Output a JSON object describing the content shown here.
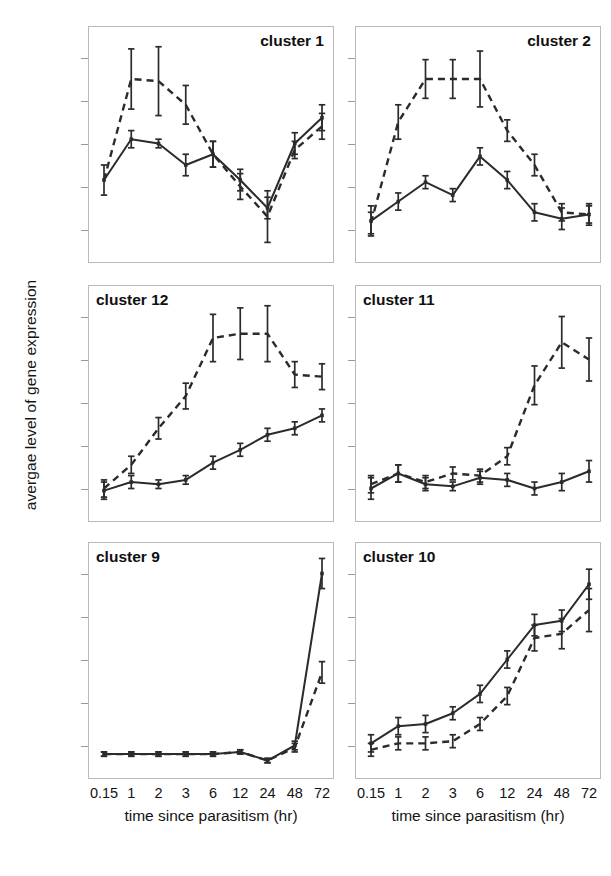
{
  "figure": {
    "y_axis_label": "avergae level of gene expression",
    "x_axis_label": "time since parasitism (hr)",
    "x_tick_labels": [
      "0.15",
      "1",
      "2",
      "3",
      "6",
      "12",
      "24",
      "48",
      "72"
    ],
    "line_color": "#2b2b2b",
    "frame_color": "#b9b9b9",
    "background": "#ffffff"
  },
  "panels": [
    {
      "label": "cluster 1",
      "label_side": "right"
    },
    {
      "label": "cluster 2",
      "label_side": "right"
    },
    {
      "label": "cluster 12",
      "label_side": "left"
    },
    {
      "label": "cluster 11",
      "label_side": "left"
    },
    {
      "label": "cluster 9",
      "label_side": "left"
    },
    {
      "label": "cluster 10",
      "label_side": "left"
    }
  ],
  "chart_data": [
    {
      "type": "line",
      "title": "cluster 1",
      "xlabel": "time since parasitism (hr)",
      "ylabel": "avergae level of gene expression",
      "x": [
        0.15,
        1,
        2,
        3,
        6,
        12,
        24,
        48,
        72
      ],
      "categories": [
        "0.15",
        "1",
        "2",
        "3",
        "6",
        "12",
        "24",
        "48",
        "72"
      ],
      "xscale": "categorical",
      "ylim": [
        0,
        1
      ],
      "grid": false,
      "legend": "none",
      "series": [
        {
          "name": "solid",
          "style": "solid",
          "values": [
            0.33,
            0.52,
            0.5,
            0.4,
            0.45,
            0.33,
            0.2,
            0.5,
            0.62
          ],
          "errors": [
            0.07,
            0.04,
            0.02,
            0.05,
            0.06,
            0.05,
            0.05,
            0.05,
            0.06
          ]
        },
        {
          "name": "dashed",
          "style": "dashed",
          "values": [
            0.33,
            0.8,
            0.79,
            0.68,
            0.45,
            0.3,
            0.16,
            0.47,
            0.58
          ],
          "errors": [
            0.0,
            0.14,
            0.16,
            0.09,
            0.06,
            0.06,
            0.12,
            0.04,
            0.06
          ]
        }
      ]
    },
    {
      "type": "line",
      "title": "cluster 2",
      "xlabel": "time since parasitism (hr)",
      "ylabel": "avergae level of gene expression",
      "x": [
        0.15,
        1,
        2,
        3,
        6,
        12,
        24,
        48,
        72
      ],
      "categories": [
        "0.15",
        "1",
        "2",
        "3",
        "6",
        "12",
        "24",
        "48",
        "72"
      ],
      "xscale": "categorical",
      "ylim": [
        0,
        1
      ],
      "grid": false,
      "legend": "none",
      "series": [
        {
          "name": "solid",
          "style": "solid",
          "values": [
            0.14,
            0.23,
            0.32,
            0.26,
            0.44,
            0.33,
            0.18,
            0.15,
            0.17
          ],
          "errors": [
            0.07,
            0.04,
            0.03,
            0.03,
            0.04,
            0.04,
            0.04,
            0.05,
            0.05
          ]
        },
        {
          "name": "dashed",
          "style": "dashed",
          "values": [
            0.13,
            0.6,
            0.8,
            0.8,
            0.8,
            0.56,
            0.4,
            0.18,
            0.17
          ],
          "errors": [
            0.05,
            0.08,
            0.09,
            0.09,
            0.13,
            0.05,
            0.05,
            0.04,
            0.04
          ]
        }
      ]
    },
    {
      "type": "line",
      "title": "cluster 12",
      "xlabel": "time since parasitism (hr)",
      "ylabel": "avergae level of gene expression",
      "x": [
        0.15,
        1,
        2,
        3,
        6,
        12,
        24,
        48,
        72
      ],
      "categories": [
        "0.15",
        "1",
        "2",
        "3",
        "6",
        "12",
        "24",
        "48",
        "72"
      ],
      "xscale": "categorical",
      "ylim": [
        0,
        1
      ],
      "grid": false,
      "legend": "none",
      "series": [
        {
          "name": "solid",
          "style": "solid",
          "values": [
            0.09,
            0.13,
            0.12,
            0.14,
            0.22,
            0.28,
            0.35,
            0.38,
            0.44
          ],
          "errors": [
            0.04,
            0.03,
            0.02,
            0.02,
            0.03,
            0.03,
            0.03,
            0.03,
            0.03
          ]
        },
        {
          "name": "dashed",
          "style": "dashed",
          "values": [
            0.1,
            0.21,
            0.38,
            0.53,
            0.8,
            0.82,
            0.82,
            0.63,
            0.62
          ],
          "errors": [
            0.04,
            0.04,
            0.05,
            0.06,
            0.11,
            0.12,
            0.13,
            0.06,
            0.06
          ]
        }
      ]
    },
    {
      "type": "line",
      "title": "cluster 11",
      "xlabel": "time since parasitism (hr)",
      "ylabel": "avergae level of gene expression",
      "x": [
        0.15,
        1,
        2,
        3,
        6,
        12,
        24,
        48,
        72
      ],
      "categories": [
        "0.15",
        "1",
        "2",
        "3",
        "6",
        "12",
        "24",
        "48",
        "72"
      ],
      "xscale": "categorical",
      "ylim": [
        0,
        1
      ],
      "grid": false,
      "legend": "none",
      "series": [
        {
          "name": "solid",
          "style": "solid",
          "values": [
            0.1,
            0.17,
            0.12,
            0.11,
            0.15,
            0.14,
            0.1,
            0.13,
            0.18
          ],
          "errors": [
            0.05,
            0.04,
            0.03,
            0.02,
            0.03,
            0.03,
            0.03,
            0.04,
            0.05
          ]
        },
        {
          "name": "dashed",
          "style": "dashed",
          "values": [
            0.12,
            0.17,
            0.13,
            0.17,
            0.16,
            0.25,
            0.58,
            0.78,
            0.7
          ],
          "errors": [
            0.04,
            0.04,
            0.03,
            0.03,
            0.03,
            0.04,
            0.09,
            0.12,
            0.1
          ]
        }
      ]
    },
    {
      "type": "line",
      "title": "cluster 9",
      "xlabel": "time since parasitism (hr)",
      "ylabel": "avergae level of gene expression",
      "x": [
        0.15,
        1,
        2,
        3,
        6,
        12,
        24,
        48,
        72
      ],
      "categories": [
        "0.15",
        "1",
        "2",
        "3",
        "6",
        "12",
        "24",
        "48",
        "72"
      ],
      "xscale": "categorical",
      "ylim": [
        0,
        1
      ],
      "grid": false,
      "legend": "none",
      "series": [
        {
          "name": "solid",
          "style": "solid",
          "values": [
            0.06,
            0.06,
            0.06,
            0.06,
            0.06,
            0.07,
            0.03,
            0.1,
            0.9
          ],
          "errors": [
            0.01,
            0.01,
            0.01,
            0.01,
            0.01,
            0.01,
            0.01,
            0.02,
            0.07
          ]
        },
        {
          "name": "dashed",
          "style": "dashed",
          "values": [
            0.06,
            0.06,
            0.06,
            0.06,
            0.06,
            0.07,
            0.03,
            0.09,
            0.44
          ],
          "errors": [
            0.01,
            0.01,
            0.01,
            0.01,
            0.01,
            0.01,
            0.01,
            0.02,
            0.05
          ]
        }
      ]
    },
    {
      "type": "line",
      "title": "cluster 10",
      "xlabel": "time since parasitism (hr)",
      "ylabel": "avergae level of gene expression",
      "x": [
        0.15,
        1,
        2,
        3,
        6,
        12,
        24,
        48,
        72
      ],
      "categories": [
        "0.15",
        "1",
        "2",
        "3",
        "6",
        "12",
        "24",
        "48",
        "72"
      ],
      "xscale": "categorical",
      "ylim": [
        0,
        1
      ],
      "grid": false,
      "legend": "none",
      "series": [
        {
          "name": "solid",
          "style": "solid",
          "values": [
            0.11,
            0.19,
            0.2,
            0.25,
            0.34,
            0.5,
            0.66,
            0.68,
            0.85
          ],
          "errors": [
            0.04,
            0.04,
            0.04,
            0.03,
            0.04,
            0.04,
            0.05,
            0.05,
            0.07
          ]
        },
        {
          "name": "dashed",
          "style": "dashed",
          "values": [
            0.08,
            0.11,
            0.11,
            0.12,
            0.2,
            0.33,
            0.6,
            0.62,
            0.73
          ],
          "errors": [
            0.03,
            0.03,
            0.03,
            0.03,
            0.03,
            0.04,
            0.06,
            0.07,
            0.1
          ]
        }
      ]
    }
  ]
}
